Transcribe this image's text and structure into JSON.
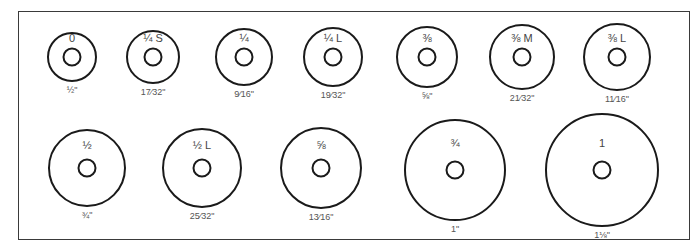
{
  "diagram": {
    "rows": [
      {
        "washers": [
          {
            "size": "0",
            "outer_diameter": "½\"",
            "cx": 72,
            "cy": 57,
            "r": 24
          },
          {
            "size": "¼ S",
            "outer_diameter": "17⁄32\"",
            "cx": 153,
            "cy": 57,
            "r": 26
          },
          {
            "size": "¼",
            "outer_diameter": "9⁄16\"",
            "cx": 244,
            "cy": 57,
            "r": 28
          },
          {
            "size": "¼ L",
            "outer_diameter": "19⁄32\"",
            "cx": 333,
            "cy": 57,
            "r": 29
          },
          {
            "size": "⅜",
            "outer_diameter": "⅝\"",
            "cx": 427,
            "cy": 57,
            "r": 30
          },
          {
            "size": "⅜ M",
            "outer_diameter": "21⁄32\"",
            "cx": 522,
            "cy": 57,
            "r": 32
          },
          {
            "size": "⅜ L",
            "outer_diameter": "11⁄16\"",
            "cx": 617,
            "cy": 57,
            "r": 33
          }
        ]
      },
      {
        "washers": [
          {
            "size": "½",
            "outer_diameter": "¾\"",
            "cx": 87,
            "cy": 168,
            "r": 38
          },
          {
            "size": "½ L",
            "outer_diameter": "25⁄32\"",
            "cx": 202,
            "cy": 168,
            "r": 39
          },
          {
            "size": "⅝",
            "outer_diameter": "13⁄16\"",
            "cx": 321,
            "cy": 168,
            "r": 40
          },
          {
            "size": "¾",
            "outer_diameter": "1\"",
            "cx": 455,
            "cy": 170,
            "r": 50
          },
          {
            "size": "1",
            "outer_diameter": "1⅛\"",
            "cx": 602,
            "cy": 170,
            "r": 56
          }
        ]
      }
    ]
  },
  "colors": {
    "stroke": "#1a1a1a",
    "frame": "#3a3a3a",
    "text": "#444444",
    "background": "#ffffff"
  }
}
